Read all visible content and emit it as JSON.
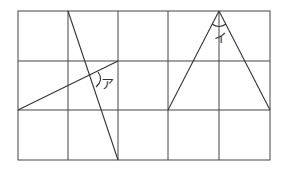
{
  "diagram": {
    "grid": {
      "x": [
        18,
        68,
        118,
        168,
        219,
        270
      ],
      "y": [
        11,
        61,
        110,
        160
      ],
      "stroke": "#444444"
    },
    "figure_left": {
      "line1": {
        "x1": 68,
        "y1": 11,
        "x2": 118,
        "y2": 160
      },
      "line2": {
        "x1": 18,
        "y1": 110,
        "x2": 118,
        "y2": 61
      },
      "angle_label": "ア"
    },
    "figure_right": {
      "apex": [
        219,
        11
      ],
      "base_left": [
        168,
        110
      ],
      "base_right": [
        270,
        110
      ],
      "angle_label": "イ"
    }
  }
}
